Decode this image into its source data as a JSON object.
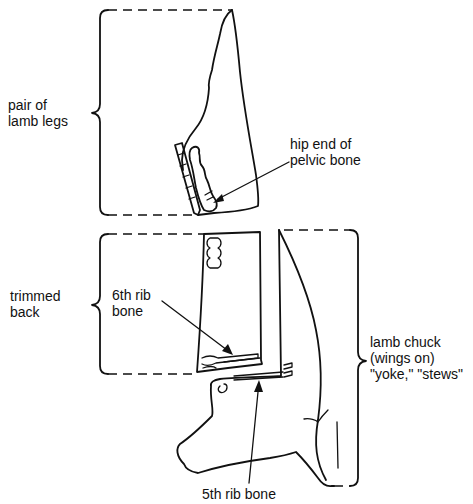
{
  "diagram": {
    "colors": {
      "ink": "#111111",
      "background": "#ffffff"
    },
    "labels": {
      "legs": {
        "lines": [
          "pair of",
          "lamb legs"
        ]
      },
      "pelvic": {
        "lines": [
          "hip end of",
          "pelvic bone"
        ]
      },
      "back": {
        "lines": [
          "trimmed",
          "back"
        ]
      },
      "rib6": {
        "lines": [
          "6th rib",
          "bone"
        ]
      },
      "chuck": {
        "lines": [
          "lamb chuck",
          "(wings on)",
          "\"yoke,\"  \"stews\""
        ]
      },
      "rib5": {
        "lines": [
          "5th rib bone"
        ]
      }
    }
  }
}
